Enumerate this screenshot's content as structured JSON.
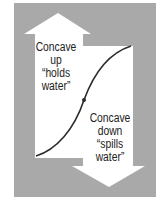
{
  "figure": {
    "colors": {
      "page_background": "#ffffff",
      "panel": "#a9a9a9",
      "arrow_fill": "#ffffff",
      "curve": "#2b2b2b",
      "text": "#222222"
    },
    "up_arrow": {
      "direction": "up",
      "label_lines": [
        "Concave",
        "up",
        "“holds",
        "water”"
      ]
    },
    "down_arrow": {
      "direction": "down",
      "label_lines": [
        "Concave",
        "down",
        "“spills",
        "water”"
      ]
    },
    "curve": {
      "shape": "s-curve",
      "inflection_point_marker": "dot"
    }
  }
}
